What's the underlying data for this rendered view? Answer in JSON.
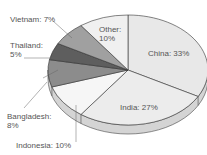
{
  "chart_data": {
    "type": "pie",
    "title": "",
    "categories": [
      "China",
      "India",
      "Indonesia",
      "Bangladesh",
      "Thailand",
      "Vietnam",
      "Other"
    ],
    "values": [
      33,
      27,
      10,
      8,
      5,
      7,
      10
    ],
    "unit": "%",
    "colors": [
      "#e8e8e8",
      "#ececec",
      "#f6f6f6",
      "#8c8c8c",
      "#5e5e5e",
      "#a0a0a0",
      "#f0f0f0"
    ],
    "style": "3d-tilted",
    "labels": [
      {
        "text1": "China: 33%",
        "text2": ""
      },
      {
        "text1": "India: 27%",
        "text2": ""
      },
      {
        "text1": "Indonesia: 10%",
        "text2": ""
      },
      {
        "text1": "Bangladesh:",
        "text2": "8%"
      },
      {
        "text1": "Thailand:",
        "text2": "5%"
      },
      {
        "text1": "Vietnam: 7%",
        "text2": ""
      },
      {
        "text1": "Other:",
        "text2": "10%"
      }
    ]
  }
}
